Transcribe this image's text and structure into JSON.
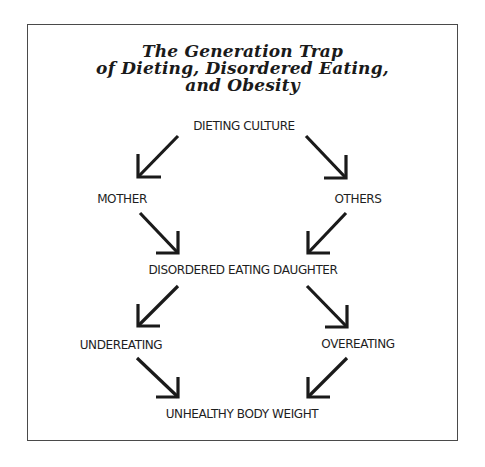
{
  "diagram": {
    "title_lines": [
      "The Generation Trap",
      "of Dieting, Disordered Eating,",
      "and Obesity"
    ],
    "nodes": {
      "dieting_culture": "DIETING CULTURE",
      "mother": "MOTHER",
      "others": "OTHERS",
      "disordered_eating_daughter": "DISORDERED EATING DAUGHTER",
      "undereating": "UNDEREATING",
      "overeating": "OVEREATING",
      "unhealthy_body_weight": "UNHEALTHY BODY WEIGHT"
    },
    "edges": [
      {
        "from": "DIETING CULTURE",
        "to": "MOTHER"
      },
      {
        "from": "DIETING CULTURE",
        "to": "OTHERS"
      },
      {
        "from": "MOTHER",
        "to": "DISORDERED EATING DAUGHTER"
      },
      {
        "from": "OTHERS",
        "to": "DISORDERED EATING DAUGHTER"
      },
      {
        "from": "DISORDERED EATING DAUGHTER",
        "to": "UNDEREATING"
      },
      {
        "from": "DISORDERED EATING DAUGHTER",
        "to": "OVEREATING"
      },
      {
        "from": "UNDEREATING",
        "to": "UNHEALTHY BODY WEIGHT"
      },
      {
        "from": "OVEREATING",
        "to": "UNHEALTHY BODY WEIGHT"
      }
    ],
    "colors": {
      "ink": "#1a1a1a",
      "border": "#4a4a4a",
      "background": "#ffffff"
    }
  }
}
